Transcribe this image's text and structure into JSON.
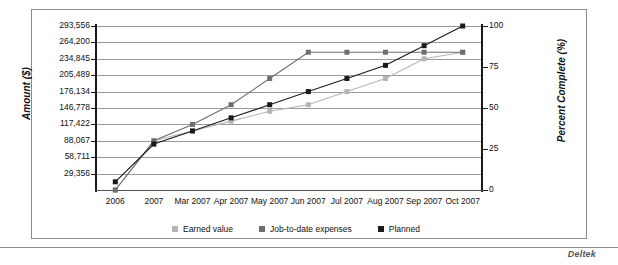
{
  "brand": "Deltek",
  "chart_data": {
    "type": "line",
    "title": "",
    "xlabel": "",
    "ylabel": "Amount ($)",
    "y2label": "Percent Complete (%)",
    "grid": true,
    "legend_position": "bottom",
    "categories": [
      "2006",
      "2007",
      "Mar 2007",
      "Apr 2007",
      "May 2007",
      "Jun 2007",
      "Jul 2007",
      "Aug 2007",
      "Sep 2007",
      "Oct 2007"
    ],
    "ylim": [
      0,
      293556
    ],
    "yticks": [
      29356,
      58711,
      88067,
      117422,
      146778,
      176134,
      205489,
      234845,
      264200,
      293556
    ],
    "ytick_labels": [
      "29,356",
      "58,711",
      "88,067",
      "117,422",
      "146,778",
      "176,134",
      "205,489",
      "234,845",
      "264,200",
      "293,556"
    ],
    "y2lim": [
      0,
      100
    ],
    "y2ticks": [
      0,
      25,
      50,
      75,
      100
    ],
    "y2tick_labels": [
      "0",
      "25",
      "50",
      "75",
      "100"
    ],
    "series": [
      {
        "name": "Earned value",
        "color": "#b5b5b5",
        "marker": "square",
        "values": [
          0,
          88067,
          105680,
          123293,
          140906,
          152640,
          176134,
          199627,
          234845,
          246579
        ]
      },
      {
        "name": "Job-to-date expenses",
        "color": "#6e6e6e",
        "marker": "square",
        "values": [
          0,
          88067,
          117422,
          152640,
          199627,
          246579,
          246579,
          246579,
          246579,
          246579
        ]
      },
      {
        "name": "Planned",
        "color": "#1a1a1a",
        "marker": "square",
        "values": [
          14678,
          82194,
          105680,
          129166,
          152640,
          176134,
          199627,
          223120,
          258328,
          293556
        ]
      }
    ]
  }
}
